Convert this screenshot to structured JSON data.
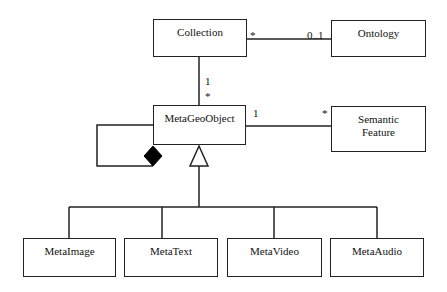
{
  "diagram": {
    "type": "UML class diagram",
    "classes": {
      "collection": "Collection",
      "ontology": "Ontology",
      "metageoobject": "MetaGeoObject",
      "semantic_feature_line1": "Semantic",
      "semantic_feature_line2": "Feature",
      "metaimage": "MetaImage",
      "metatext": "MetaText",
      "metavideo": "MetaVideo",
      "metaaudio": "MetaAudio"
    },
    "multiplicities": {
      "collection_to_ontology_source": "*",
      "collection_to_ontology_target": "0..1",
      "collection_to_metageoobject_source": "1",
      "collection_to_metageoobject_target": "*",
      "metageoobject_to_semantic_source": "1",
      "metageoobject_to_semantic_target": "*"
    },
    "relations": [
      {
        "from": "Collection",
        "to": "Ontology",
        "kind": "association",
        "from_mult": "*",
        "to_mult": "0..1"
      },
      {
        "from": "Collection",
        "to": "MetaGeoObject",
        "kind": "association",
        "from_mult": "1",
        "to_mult": "*"
      },
      {
        "from": "MetaGeoObject",
        "to": "Semantic Feature",
        "kind": "association",
        "from_mult": "1",
        "to_mult": "*"
      },
      {
        "from": "MetaGeoObject",
        "to": "MetaGeoObject",
        "kind": "composition (self)"
      },
      {
        "from": "MetaImage",
        "to": "MetaGeoObject",
        "kind": "generalization"
      },
      {
        "from": "MetaText",
        "to": "MetaGeoObject",
        "kind": "generalization"
      },
      {
        "from": "MetaVideo",
        "to": "MetaGeoObject",
        "kind": "generalization"
      },
      {
        "from": "MetaAudio",
        "to": "MetaGeoObject",
        "kind": "generalization"
      }
    ]
  }
}
